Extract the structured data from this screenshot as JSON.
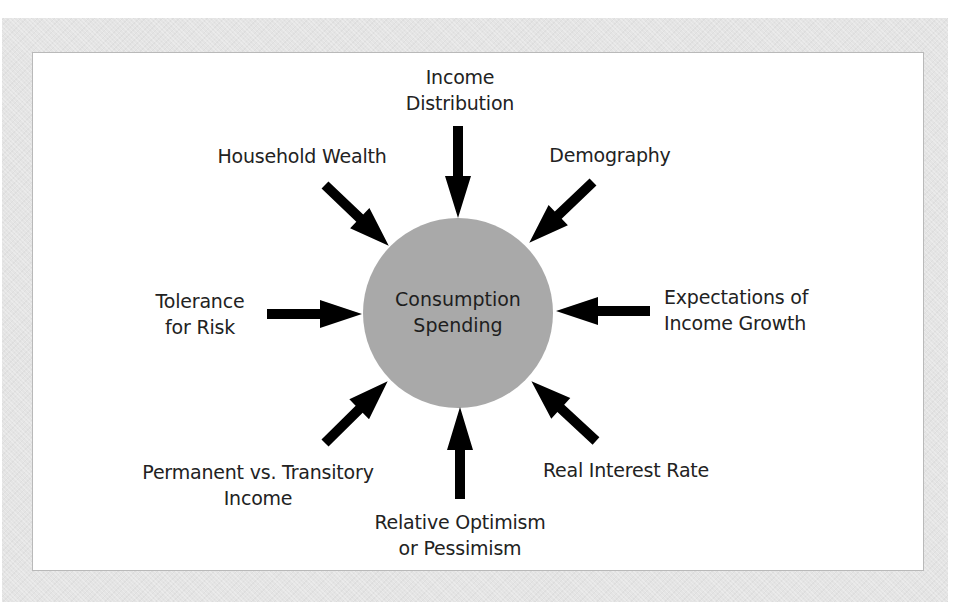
{
  "diagram": {
    "center": {
      "label_lines": [
        "Consumption",
        "Spending"
      ],
      "fill_color": "#a9a9a9"
    },
    "arrow_color": "#000000",
    "factors": [
      {
        "id": "income-distribution",
        "lines": [
          "Income",
          "Distribution"
        ],
        "direction": "from-top"
      },
      {
        "id": "household-wealth",
        "lines": [
          "Household Wealth"
        ],
        "direction": "from-top-left"
      },
      {
        "id": "demography",
        "lines": [
          "Demography"
        ],
        "direction": "from-top-right"
      },
      {
        "id": "tolerance-for-risk",
        "lines": [
          "Tolerance",
          "for Risk"
        ],
        "direction": "from-left"
      },
      {
        "id": "expectations-of-income-growth",
        "lines": [
          "Expectations of",
          "Income Growth"
        ],
        "direction": "from-right"
      },
      {
        "id": "permanent-vs-transitory-income",
        "lines": [
          "Permanent vs. Transitory",
          "Income"
        ],
        "direction": "from-bottom-left"
      },
      {
        "id": "relative-optimism-or-pessimism",
        "lines": [
          "Relative Optimism",
          "or Pessimism"
        ],
        "direction": "from-bottom"
      },
      {
        "id": "real-interest-rate",
        "lines": [
          "Real Interest Rate"
        ],
        "direction": "from-bottom-right"
      }
    ]
  }
}
